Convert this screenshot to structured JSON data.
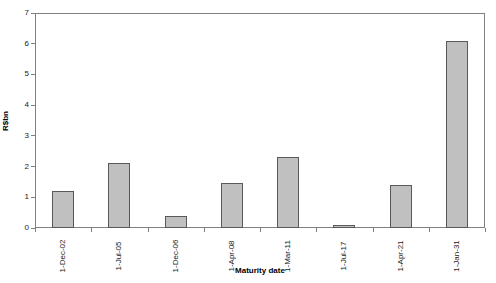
{
  "chart_data": {
    "type": "bar",
    "title": "",
    "xlabel": "Maturity date",
    "ylabel": "R$bn",
    "categories": [
      "1-Dec-02",
      "1-Jul-05",
      "1-Dec-06",
      "1-Apr-08",
      "1-Mar-11",
      "1-Jul-17",
      "1-Apr-21",
      "1-Jan-31"
    ],
    "values": [
      1.2,
      2.1,
      0.4,
      1.45,
      2.3,
      0.1,
      1.4,
      6.1
    ],
    "ylim": [
      0,
      7
    ],
    "yticks": [
      0,
      1,
      2,
      3,
      4,
      5,
      6,
      7
    ],
    "grid": false,
    "legend": "none",
    "bar_fill_color": "#c0c0c0",
    "bar_border_color": "#595959",
    "axis_color": "#808080",
    "background_color": "#ffffff"
  }
}
